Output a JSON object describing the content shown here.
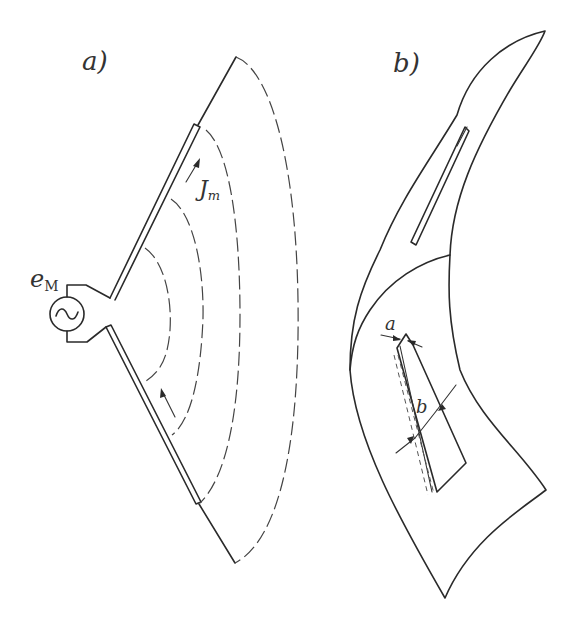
{
  "figure": {
    "panel_a": {
      "label": "a)",
      "source_label_main": "e",
      "source_label_sub": "M",
      "current_label_main": "J",
      "current_label_sub": "m",
      "generator_symbol": "~"
    },
    "panel_b": {
      "label": "b)",
      "dimension_a": "a",
      "dimension_b": "b"
    }
  }
}
